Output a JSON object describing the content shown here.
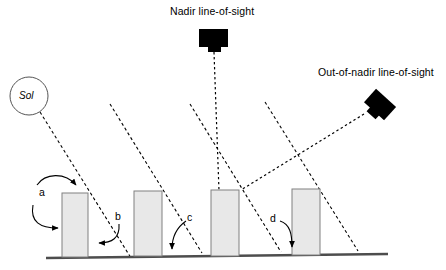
{
  "figure": {
    "title_nadir": "Nadir line-of-sight",
    "title_outnadir": "Out-of-nadir line-of-sight",
    "sun_label": "Sol",
    "feature_labels": {
      "a": "a",
      "b": "b",
      "c": "c",
      "d": "d"
    },
    "colors": {
      "ink": "#000000",
      "building_fill": "#e8e8e8",
      "building_stroke": "#808080",
      "ground": "#4d4d4d",
      "sun_circle_stroke": "#555555"
    },
    "elements": {
      "sun_icon": "sun-circle-icon",
      "nadir_camera_icon": "camera-nadir-icon",
      "outnadir_camera_icon": "camera-out-of-nadir-icon",
      "ground_line": "ground-line",
      "buildings": [
        {
          "name": "building-1",
          "x": 62,
          "y": 193,
          "w": 26,
          "h": 63
        },
        {
          "name": "building-2",
          "x": 134,
          "y": 191,
          "w": 28,
          "h": 64
        },
        {
          "name": "building-3",
          "x": 211,
          "y": 190,
          "w": 28,
          "h": 65
        },
        {
          "name": "building-4",
          "x": 292,
          "y": 189,
          "w": 28,
          "h": 65
        }
      ],
      "sun_rays": [
        {
          "name": "sun-ray-1",
          "x1": 40,
          "y1": 112,
          "x2": 131,
          "y2": 258
        },
        {
          "name": "sun-ray-2",
          "x1": 110,
          "y1": 104,
          "x2": 202,
          "y2": 253
        },
        {
          "name": "sun-ray-3",
          "x1": 190,
          "y1": 104,
          "x2": 281,
          "y2": 252
        },
        {
          "name": "sun-ray-4",
          "x1": 265,
          "y1": 102,
          "x2": 358,
          "y2": 251
        }
      ],
      "nadir_sight_line": {
        "name": "nadir-sight-line",
        "x1": 214,
        "y1": 52,
        "x2": 219,
        "y2": 190
      },
      "outnadir_sight_line": {
        "name": "out-of-nadir-sight-line",
        "x1": 363,
        "y1": 113,
        "x2": 241,
        "y2": 190
      }
    }
  }
}
